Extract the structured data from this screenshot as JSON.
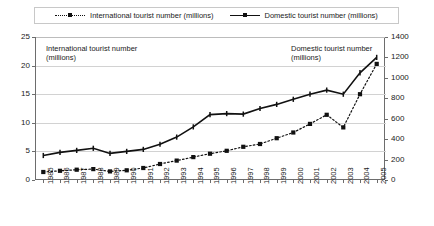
{
  "legend": {
    "items": [
      {
        "label": "International tourist number (millions)",
        "style": "dotted-square-marker",
        "color": "#111111"
      },
      {
        "label": "Domestic tourist number (millions)",
        "style": "solid-marker",
        "color": "#111111"
      }
    ]
  },
  "annotations": [
    {
      "name": "annotation-international",
      "text": "International tourist number\n(millions)"
    },
    {
      "name": "annotation-domestic",
      "text": "Domestic tourist number\n(millions)"
    }
  ],
  "axes": {
    "left": {
      "ticks": [
        "0",
        "5",
        "10",
        "15",
        "20",
        "25"
      ],
      "min": 0,
      "max": 25,
      "step": 5
    },
    "right": {
      "ticks": [
        "0",
        "200",
        "400",
        "600",
        "800",
        "1000",
        "1200",
        "1400"
      ],
      "min": 0,
      "max": 1400,
      "step": 200
    },
    "bottom": {
      "ticks": [
        "1985",
        "1986",
        "1987",
        "1988",
        "1989",
        "1990",
        "1991",
        "1992",
        "1993",
        "1994",
        "1995",
        "1996",
        "1997",
        "1998",
        "1999",
        "2000",
        "2001",
        "2002",
        "2003",
        "2004",
        "2005"
      ]
    }
  },
  "chart_data": {
    "type": "line",
    "title": "",
    "xlabel": "",
    "ylabel": "",
    "grid": true,
    "legend_position": "top",
    "categories": [
      "1985",
      "1986",
      "1987",
      "1988",
      "1989",
      "1990",
      "1991",
      "1992",
      "1993",
      "1994",
      "1995",
      "1996",
      "1997",
      "1998",
      "1999",
      "2000",
      "2001",
      "2002",
      "2003",
      "2004",
      "2005"
    ],
    "series": [
      {
        "name": "International tourist number (millions)",
        "axis": "left",
        "ylim": [
          0,
          25
        ],
        "marker": "square",
        "linestyle": "dotted",
        "color": "#111111",
        "values": [
          1.4,
          1.6,
          1.8,
          1.9,
          1.5,
          1.7,
          2.1,
          2.8,
          3.4,
          4.0,
          4.6,
          5.1,
          5.8,
          6.3,
          7.3,
          8.3,
          9.8,
          11.4,
          9.2,
          15.0,
          20.3
        ]
      },
      {
        "name": "Domestic tourist number (millions)",
        "axis": "right",
        "ylim": [
          0,
          1400
        ],
        "marker": "plus",
        "linestyle": "solid",
        "color": "#111111",
        "values": [
          240,
          270,
          290,
          310,
          260,
          280,
          300,
          350,
          420,
          520,
          640,
          650,
          645,
          700,
          740,
          790,
          840,
          880,
          840,
          1050,
          1200
        ]
      }
    ]
  }
}
